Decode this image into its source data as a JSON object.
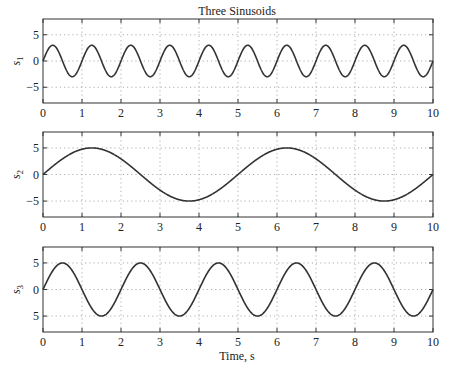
{
  "figure": {
    "title": "Three Sinusoids",
    "xlabel": "Time, s"
  },
  "chart_data": [
    {
      "type": "line",
      "title": "Three Sinusoids",
      "xlabel": "",
      "ylabel": "s1",
      "ylabel_main": "s",
      "ylabel_sub": "1",
      "xlim": [
        0,
        10
      ],
      "ylim": [
        -8,
        8
      ],
      "xticks": [
        0,
        1,
        2,
        3,
        4,
        5,
        6,
        7,
        8,
        9,
        10
      ],
      "yticks": [
        5,
        0,
        -5
      ],
      "ytick_labels": [
        "5",
        "0",
        "−5"
      ],
      "grid": true,
      "series": [
        {
          "name": "s1",
          "function": "3*sin(2*pi*1*t)",
          "amplitude": 3,
          "frequency_hz": 1,
          "x": [
            0,
            0.25,
            0.5,
            0.75,
            1,
            1.25,
            1.5,
            1.75,
            2,
            2.25,
            2.5,
            2.75,
            3,
            3.25,
            3.5,
            3.75,
            4,
            4.25,
            4.5,
            4.75,
            5,
            5.25,
            5.5,
            5.75,
            6,
            6.25,
            6.5,
            6.75,
            7,
            7.25,
            7.5,
            7.75,
            8,
            8.25,
            8.5,
            8.75,
            9,
            9.25,
            9.5,
            9.75,
            10
          ],
          "values": [
            0,
            3,
            0,
            -3,
            0,
            3,
            0,
            -3,
            0,
            3,
            0,
            -3,
            0,
            3,
            0,
            -3,
            0,
            3,
            0,
            -3,
            0,
            3,
            0,
            -3,
            0,
            3,
            0,
            -3,
            0,
            3,
            0,
            -3,
            0,
            3,
            0,
            -3,
            0,
            3,
            0,
            -3,
            0
          ]
        }
      ]
    },
    {
      "type": "line",
      "xlabel": "",
      "ylabel": "s2",
      "ylabel_main": "s",
      "ylabel_sub": "2",
      "xlim": [
        0,
        10
      ],
      "ylim": [
        -8,
        8
      ],
      "xticks": [
        0,
        1,
        2,
        3,
        4,
        5,
        6,
        7,
        8,
        9,
        10
      ],
      "yticks": [
        5,
        0,
        -5
      ],
      "ytick_labels": [
        "5",
        "0",
        "−5"
      ],
      "grid": true,
      "series": [
        {
          "name": "s2",
          "function": "5*sin(2*pi*0.2*t)",
          "amplitude": 5,
          "frequency_hz": 0.2,
          "x": [
            0,
            1.25,
            2.5,
            3.75,
            5,
            6.25,
            7.5,
            8.75,
            10
          ],
          "values": [
            0,
            5,
            0,
            -5,
            0,
            5,
            0,
            -5,
            0
          ]
        }
      ]
    },
    {
      "type": "line",
      "xlabel": "Time, s",
      "ylabel": "s3",
      "ylabel_main": "s",
      "ylabel_sub": "3",
      "xlim": [
        0,
        10
      ],
      "ylim": [
        -8,
        8
      ],
      "xticks": [
        0,
        1,
        2,
        3,
        4,
        5,
        6,
        7,
        8,
        9,
        10
      ],
      "yticks": [
        5,
        0,
        -5
      ],
      "ytick_labels": [
        "5",
        "0",
        "5"
      ],
      "grid": true,
      "series": [
        {
          "name": "s3",
          "function": "5*sin(2*pi*0.5*t)",
          "amplitude": 5,
          "frequency_hz": 0.5,
          "x": [
            0,
            0.5,
            1,
            1.5,
            2,
            2.5,
            3,
            3.5,
            4,
            4.5,
            5,
            5.5,
            6,
            6.5,
            7,
            7.5,
            8,
            8.5,
            9,
            9.5,
            10
          ],
          "values": [
            0,
            5,
            0,
            -5,
            0,
            5,
            0,
            -5,
            0,
            5,
            0,
            -5,
            0,
            5,
            0,
            -5,
            0,
            5,
            0,
            -5,
            0
          ]
        }
      ]
    }
  ],
  "colors": {
    "line": "#333333",
    "grid": "#999999",
    "frame": "#333333"
  }
}
